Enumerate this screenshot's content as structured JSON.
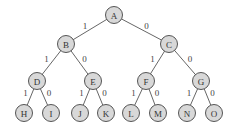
{
  "tree": {
    "nodes": [
      {
        "id": "A",
        "label": "A",
        "x": 114,
        "y": 15
      },
      {
        "id": "B",
        "label": "B",
        "x": 66,
        "y": 44
      },
      {
        "id": "C",
        "label": "C",
        "x": 169,
        "y": 44
      },
      {
        "id": "D",
        "label": "D",
        "x": 37,
        "y": 81
      },
      {
        "id": "E",
        "label": "E",
        "x": 93,
        "y": 81
      },
      {
        "id": "F",
        "label": "F",
        "x": 146,
        "y": 81
      },
      {
        "id": "G",
        "label": "G",
        "x": 201,
        "y": 81
      },
      {
        "id": "H",
        "label": "H",
        "x": 24,
        "y": 113
      },
      {
        "id": "I",
        "label": "I",
        "x": 51,
        "y": 113
      },
      {
        "id": "J",
        "label": "J",
        "x": 80,
        "y": 113
      },
      {
        "id": "K",
        "label": "K",
        "x": 106,
        "y": 113
      },
      {
        "id": "L",
        "label": "L",
        "x": 131,
        "y": 113
      },
      {
        "id": "M",
        "label": "M",
        "x": 158,
        "y": 113
      },
      {
        "id": "N",
        "label": "N",
        "x": 187,
        "y": 113
      },
      {
        "id": "O",
        "label": "O",
        "x": 214,
        "y": 113
      }
    ],
    "edges": [
      {
        "from": "A",
        "to": "B",
        "label": "1"
      },
      {
        "from": "A",
        "to": "C",
        "label": "0"
      },
      {
        "from": "B",
        "to": "D",
        "label": "1"
      },
      {
        "from": "B",
        "to": "E",
        "label": "0"
      },
      {
        "from": "C",
        "to": "F",
        "label": "1"
      },
      {
        "from": "C",
        "to": "G",
        "label": "0"
      },
      {
        "from": "D",
        "to": "H",
        "label": "1"
      },
      {
        "from": "D",
        "to": "I",
        "label": "0"
      },
      {
        "from": "E",
        "to": "J",
        "label": "1"
      },
      {
        "from": "E",
        "to": "K",
        "label": "0"
      },
      {
        "from": "F",
        "to": "L",
        "label": "1"
      },
      {
        "from": "F",
        "to": "M",
        "label": "0"
      },
      {
        "from": "G",
        "to": "N",
        "label": "1"
      },
      {
        "from": "G",
        "to": "O",
        "label": "0"
      }
    ],
    "node_fill": "#d8d8d8",
    "node_stroke": "#555555"
  }
}
